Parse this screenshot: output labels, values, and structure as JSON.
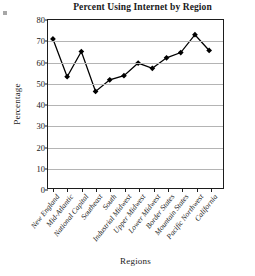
{
  "figure": {
    "marker_label": ""
  },
  "chart_data": {
    "type": "line",
    "title": "Percent Using Internet by Region",
    "xlabel": "Regions",
    "ylabel": "Percentage",
    "categories": [
      "New England",
      "Mid-Atlantic",
      "National Capital",
      "Southeast",
      "South",
      "Industrial Midwest",
      "Upper Midwest",
      "Lower Midwest",
      "Border States",
      "Mountain States",
      "Pacific Northwest",
      "California"
    ],
    "values": [
      71,
      53,
      65,
      46,
      51.5,
      53.5,
      59.5,
      57,
      62,
      64.5,
      73,
      65.5
    ],
    "ylim": [
      0,
      80
    ],
    "yticks": [
      0,
      10,
      20,
      30,
      40,
      50,
      60,
      70,
      80
    ],
    "ytick_labels": [
      "0",
      "10",
      "20",
      "30",
      "40",
      "50",
      "60",
      "70",
      "80"
    ],
    "grid": true,
    "legend": false,
    "marker": "diamond",
    "series_color": "#000000",
    "gridline_color": "#b4b4b4",
    "axis_color": "#1d1d1d"
  }
}
